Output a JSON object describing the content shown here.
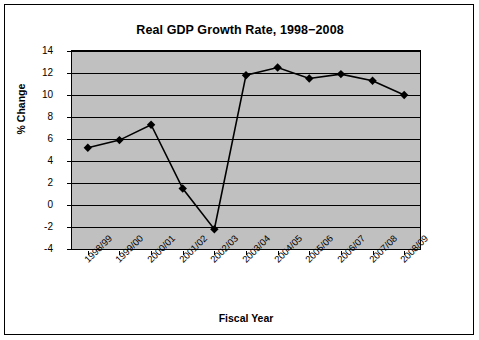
{
  "chart_data": {
    "type": "line",
    "title": "Real GDP Growth Rate, 1998−2008",
    "xlabel": "Fiscal Year",
    "ylabel": "% Change",
    "categories": [
      "1998/99",
      "1999/00",
      "2000/01",
      "2001/02",
      "2002/03",
      "2003/04",
      "2004/05",
      "2005/06",
      "2006/07",
      "2007/08",
      "2008/09"
    ],
    "values": [
      5.2,
      5.9,
      7.3,
      1.5,
      -2.2,
      11.8,
      12.5,
      11.5,
      11.9,
      11.3,
      10.0
    ],
    "ylim": [
      -4,
      14
    ],
    "yticks": [
      -4,
      -2,
      0,
      2,
      4,
      6,
      8,
      10,
      12,
      14
    ],
    "ytick_labels": [
      "-4",
      "-2",
      "0",
      "2",
      "4",
      "6",
      "8",
      "10",
      "12",
      "14"
    ],
    "grid": true,
    "legend": "none",
    "marker": "diamond",
    "series_color": "#000000",
    "plot_background": "#c0c0c0",
    "page_background": "#ffffff"
  }
}
